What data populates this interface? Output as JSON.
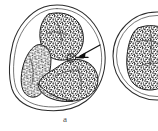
{
  "figure": {
    "panel_label": "a",
    "caption_position": "bottom-center",
    "background_color": "#ffffff",
    "ink_color": "#1e1e1e",
    "stipple_color": "#141414",
    "membrane_color": "#2c2c2c",
    "arrow_color": "#121212",
    "style": "hand-drawn pen-and-ink cytology illustration",
    "width_px": 158,
    "height_px": 131
  },
  "cells": [
    {
      "id": "cell-left",
      "name": "primary-cell",
      "description": "Rounded triangular cell with a thin double-contour cell membrane containing a large horseshoe / C-shaped densely stippled nucleus that opens toward the lower-left.",
      "membrane_shape": "rounded-triangular",
      "nucleus_shape": "horseshoe",
      "nucleus_texture": "coarse-stipple",
      "center_px": [
        58,
        57
      ],
      "radius_px": 49,
      "fully_visible": true
    },
    {
      "id": "cell-right",
      "name": "secondary-cell",
      "description": "Round cell at the right edge of the frame, partially cropped, containing a compact rounded stippled nucleus.",
      "membrane_shape": "circular",
      "nucleus_shape": "rounded-ovoid",
      "nucleus_texture": "coarse-stipple",
      "center_px": [
        157,
        56
      ],
      "radius_px": 44,
      "fully_visible": false
    }
  ],
  "annotations": [
    {
      "id": "pointer-1",
      "name": "feature-arrow",
      "type": "arrow",
      "direction": "upper-right to lower-left",
      "tail_px": [
        98,
        49
      ],
      "tip_px": [
        76,
        58
      ],
      "points_to": "small looped nucleolar notch on the upper margin of the lower nuclear lobe"
    }
  ],
  "labels": {
    "panel": "a"
  }
}
